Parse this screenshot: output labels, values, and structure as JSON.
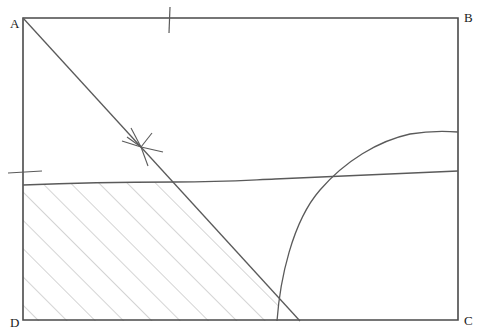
{
  "figure": {
    "background_color": "#ffffff",
    "stroke_color": "#5a5a5a",
    "frame_color": "#4a4a4a",
    "hatch_color": "#b0b0b0",
    "label_color": "#1a1a1a"
  },
  "frame": {
    "name": "rectangle-abcd",
    "x": 23,
    "y": 18,
    "width": 435,
    "height": 302,
    "path": "M 23 18 L 458 18 L 458 320 L 23 320 Z"
  },
  "labels": {
    "a": {
      "text": "A",
      "x": 10,
      "y": 28
    },
    "b": {
      "text": "B",
      "x": 464,
      "y": 22
    },
    "c": {
      "text": "C",
      "x": 464,
      "y": 325
    },
    "d": {
      "text": "D",
      "x": 10,
      "y": 327
    }
  },
  "lines": {
    "diagonal": {
      "name": "diagonal-line",
      "from_x": 23,
      "from_y": 18,
      "to_x": 300,
      "to_y": 321,
      "path": "M 23 18 L 300 321"
    },
    "wavy_horizontal": {
      "name": "wavy-horizontal-line",
      "left_y": 185,
      "right_y": 171,
      "path": "M 23 185 C 70 183, 120 182, 175 182 C 225 182, 250 180, 275 179 C 320 177, 380 174, 458 171"
    },
    "curve": {
      "name": "asymptotic-curve",
      "start_x": 277,
      "start_y": 321,
      "end_x": 458,
      "end_y": 132,
      "path": "M 277 321 C 280 280, 292 222, 320 190 C 345 161, 378 141, 410 134 C 428 131, 444 131, 458 132"
    }
  },
  "ticks": {
    "top_tick": {
      "name": "top-edge-tick",
      "x": 170,
      "y1": 7,
      "y2": 33,
      "path": "M 170 7 L 169 33"
    },
    "left_tick": {
      "name": "left-edge-tick",
      "y": 172,
      "x1": 8,
      "x2": 42,
      "path": "M 8 173 L 42 171"
    }
  },
  "marker": {
    "name": "star-marker",
    "center_x": 141,
    "center_y": 147,
    "strokes": [
      "M 141 147 L 131 128",
      "M 141 147 L 148 166",
      "M 141 147 L 122 141",
      "M 141 147 L 163 152",
      "M 141 147 L 127 137",
      "M 141 147 L 152 133"
    ]
  },
  "hatched_region": {
    "name": "hatched-area",
    "description": "Region bounded by left edge, wavy horizontal line, diagonal line, and bottom edge",
    "angle_degrees": 45,
    "spacing_px": 20,
    "path": "M 23 185 C 70 183, 120 182, 175 182 L 278 295 L 278 321 L 23 321 Z"
  }
}
